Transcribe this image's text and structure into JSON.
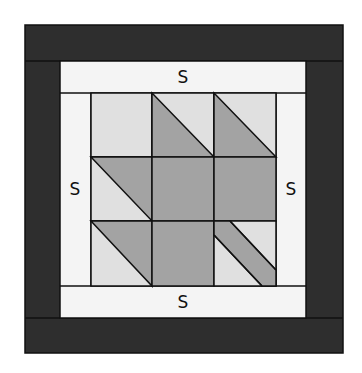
{
  "diagram": {
    "colors": {
      "outer_border": "#2e2e2e",
      "sashing": "#f4f4f4",
      "light": "#e0e0e0",
      "dark": "#a3a3a3",
      "line": "#111111"
    },
    "labels": {
      "top": "S",
      "bottom": "S",
      "left": "S",
      "right": "S"
    }
  }
}
